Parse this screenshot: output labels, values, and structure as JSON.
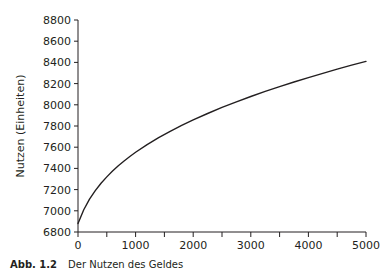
{
  "caption": {
    "number": "Abb. 1.2",
    "text": "Der Nutzen des Geldes"
  },
  "chart_data": {
    "type": "line",
    "title": "",
    "xlabel": "",
    "ylabel": "Nutzen (Einheiten)",
    "xlim": [
      0,
      5000
    ],
    "ylim": [
      6800,
      8800
    ],
    "xticks": [
      0,
      1000,
      2000,
      3000,
      4000,
      5000
    ],
    "yticks": [
      6800,
      7000,
      7200,
      7400,
      7600,
      7800,
      8000,
      8200,
      8400,
      8600,
      8800
    ],
    "xtick_labels": [
      "0",
      "1000",
      "2000",
      "3000",
      "4000",
      "5000"
    ],
    "ytick_labels": [
      "6800",
      "7000",
      "7200",
      "7400",
      "7600",
      "7800",
      "8000",
      "8200",
      "8400",
      "8600",
      "8800"
    ],
    "x_minor_tick_step": 500,
    "grid": false,
    "legend": null,
    "line_color": "#231f20",
    "series": [
      {
        "name": "Nutzen des Geldes",
        "x": [
          0,
          100,
          200,
          300,
          400,
          500,
          600,
          700,
          800,
          900,
          1000,
          1200,
          1400,
          1600,
          1800,
          2000,
          2250,
          2500,
          2750,
          3000,
          3250,
          3500,
          3750,
          4000,
          4250,
          4500,
          4750,
          5000
        ],
        "y": [
          6880,
          7010,
          7110,
          7190,
          7260,
          7320,
          7375,
          7425,
          7470,
          7512,
          7552,
          7625,
          7690,
          7750,
          7805,
          7857,
          7918,
          7975,
          8028,
          8078,
          8126,
          8171,
          8215,
          8257,
          8297,
          8336,
          8374,
          8410
        ]
      }
    ]
  }
}
